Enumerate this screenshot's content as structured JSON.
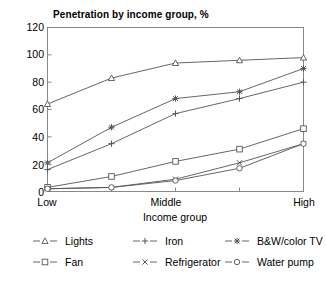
{
  "chart_data": {
    "type": "line",
    "title": "Penetration by income group, %",
    "xlabel": "Income group",
    "ylabel": "",
    "categories": [
      "Low",
      "",
      "Middle",
      "",
      "High"
    ],
    "xtick_labels": [
      "Low",
      "Middle",
      "High"
    ],
    "x": [
      0,
      1,
      2,
      3,
      4
    ],
    "ylim": [
      0,
      120
    ],
    "yticks": [
      0,
      20,
      40,
      60,
      80,
      100,
      120
    ],
    "grid": false,
    "legend_position": "bottom",
    "series": [
      {
        "name": "Lights",
        "marker": "triangle",
        "values": [
          64,
          83,
          94,
          96,
          98
        ]
      },
      {
        "name": "Iron",
        "marker": "plus",
        "values": [
          16,
          35,
          57,
          68,
          80
        ]
      },
      {
        "name": "B&W/color TV",
        "marker": "star",
        "values": [
          21,
          47,
          68,
          73,
          90
        ]
      },
      {
        "name": "Fan",
        "marker": "square",
        "values": [
          3,
          11,
          22,
          31,
          46
        ]
      },
      {
        "name": "Refrigerator",
        "marker": "x",
        "values": [
          2,
          3,
          9,
          21,
          35
        ]
      },
      {
        "name": "Water pump",
        "marker": "circle",
        "values": [
          2,
          3,
          8,
          17,
          35
        ]
      }
    ]
  },
  "colors": {
    "line": "#555555",
    "axis": "#888888",
    "text": "#000000",
    "background": "#ffffff"
  }
}
